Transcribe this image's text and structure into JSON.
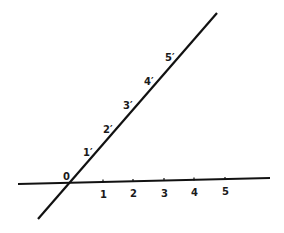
{
  "diagram": {
    "colors": {
      "line": "#111111",
      "background": "#ffffff"
    },
    "origin_label": "0",
    "horizontal_axis": {
      "labels": [
        "1",
        "2",
        "3",
        "4",
        "5"
      ]
    },
    "oblique_axis": {
      "labels": [
        "1′",
        "2′",
        "3′",
        "4′",
        "5′"
      ]
    }
  }
}
